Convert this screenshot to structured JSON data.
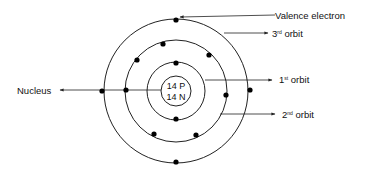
{
  "diagram": {
    "center": {
      "x": 176,
      "y": 91
    },
    "nucleus": {
      "radius": 15,
      "protons_label": "14 P",
      "neutrons_label": "14 N"
    },
    "orbits": [
      {
        "name": "1st orbit",
        "radius": 29,
        "electrons": [
          [
            176,
            63
          ],
          [
            176,
            119
          ]
        ]
      },
      {
        "name": "2nd orbit",
        "radius": 51,
        "electrons": [
          [
            163,
            44
          ],
          [
            137,
            60
          ],
          [
            209,
            55
          ],
          [
            126,
            90
          ],
          [
            226,
            95
          ],
          [
            154,
            134
          ],
          [
            196,
            135
          ]
        ]
      },
      {
        "name": "3rd orbit",
        "radius": 72,
        "electrons": [
          [
            176,
            20
          ],
          [
            102,
            91
          ],
          [
            250,
            90
          ],
          [
            176,
            162
          ]
        ]
      }
    ],
    "colors": {
      "line": "#222222",
      "electron": "#000000",
      "background": "#ffffff"
    }
  },
  "labels": {
    "valence_electron": "Valence electron",
    "third_orbit_num": "3",
    "third_orbit_sup": "rd",
    "third_orbit_text": " orbit",
    "first_orbit_num": "1",
    "first_orbit_sup": "st",
    "first_orbit_text": " orbit",
    "second_orbit_num": "2",
    "second_orbit_sup": "nd",
    "second_orbit_text": " orbit",
    "nucleus": "Nucleus"
  }
}
